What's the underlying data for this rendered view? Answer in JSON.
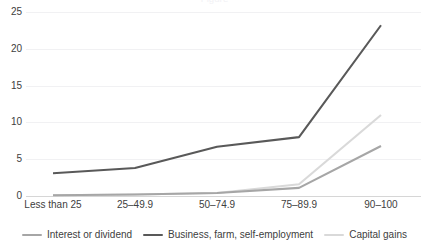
{
  "chart_data": {
    "type": "line",
    "title": "",
    "xlabel": "",
    "ylabel": "",
    "ylim": [
      0,
      25
    ],
    "ytick_step": 5,
    "yticks": [
      0,
      5,
      10,
      15,
      20,
      25
    ],
    "ytick_labels": [
      "0",
      "5",
      "10",
      "15",
      "20",
      "25"
    ],
    "grid": true,
    "grid_axis": "y",
    "legend_position": "bottom",
    "categories": [
      "Less than 25",
      "25–49.9",
      "50–74.9",
      "75–89.9",
      "90–100"
    ],
    "series": [
      {
        "name": "Interest or dividend",
        "color": "#A6A6A6",
        "values": [
          0.1,
          0.2,
          0.4,
          1.1,
          6.8
        ]
      },
      {
        "name": "Business, farm, self-employment",
        "color": "#595959",
        "values": [
          3.1,
          3.8,
          6.7,
          8.0,
          23.2
        ]
      },
      {
        "name": "Capital gains",
        "color": "#D9D9D9",
        "values": [
          0.1,
          0.2,
          0.4,
          1.6,
          11.0
        ]
      }
    ]
  },
  "legend": {
    "items": [
      {
        "label": "Interest or dividend",
        "color": "#A6A6A6"
      },
      {
        "label": "Business, farm, self-employment",
        "color": "#595959"
      },
      {
        "label": "Capital gains",
        "color": "#D9D9D9"
      }
    ]
  },
  "axis": {
    "y_labels": [
      "25",
      "20",
      "15",
      "10",
      "5",
      "0"
    ],
    "x_labels": [
      "Less than 25",
      "25–49.9",
      "50–74.9",
      "75–89.9",
      "90–100"
    ]
  },
  "title_sliver": "Figure"
}
